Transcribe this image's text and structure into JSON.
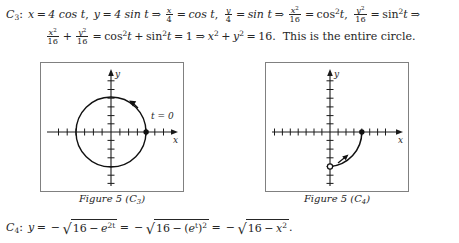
{
  "document": {
    "line1": {
      "id": "C",
      "id_sub": "3",
      "colon": ":",
      "x_var": "x",
      "eq": "=",
      "x_expr": "4 cos t",
      "comma": ",",
      "y_var": "y",
      "y_expr": "4 sin t",
      "implies": "⇒",
      "frac1_num": "x",
      "frac1_den": "4",
      "frac1_rhs": "cos t",
      "frac2_num": "y",
      "frac2_den": "4",
      "frac2_rhs": "sin t",
      "frac3_num": "x",
      "frac3_num_sup": "2",
      "frac3_den": "16",
      "frac3_rhs_base": "cos",
      "frac3_rhs_sup": "2",
      "frac3_rhs_arg": "t",
      "frac4_num": "y",
      "frac4_num_sup": "2",
      "frac4_den": "16",
      "frac4_rhs_base": "sin",
      "frac4_rhs_sup": "2",
      "frac4_rhs_arg": "t",
      "plain_text": "C3: x = 4 cos t, y = 4 sin t ⇒ x/4 = cos t, y/4 = sin t ⇒ x²/16 = cos²t, y²/16 = sin²t ⇒"
    },
    "line2": {
      "f1_num": "x",
      "f1_num_sup": "2",
      "f1_den": "16",
      "plus": "+",
      "f2_num": "y",
      "f2_num_sup": "2",
      "f2_den": "16",
      "eq1": "=",
      "cos_base": "cos",
      "cos_sup": "2",
      "cos_arg": "t",
      "plus2": "+",
      "sin_base": "sin",
      "sin_sup": "2",
      "sin_arg": "t",
      "eq2": "=",
      "one": "1",
      "implies": "⇒",
      "x_var": "x",
      "x_sup": "2",
      "plus3": "+",
      "y_var": "y",
      "y_sup": "2",
      "eq3": "=",
      "sixteen": "16.",
      "sentence": "This is the entire circle.",
      "plain_text": "x²/16 + y²/16 = cos²t + sin²t = 1 ⇒ x² + y² = 16.  This is the entire circle."
    },
    "line3": {
      "id": "C",
      "id_sub": "4",
      "colon": ":",
      "y_var": "y",
      "eq1": "=",
      "minus1": "−",
      "rad1_a": "16",
      "rad1_minus": "−",
      "rad1_b_base": "e",
      "rad1_b_sup": "2t",
      "eq2": "=",
      "minus2": "−",
      "rad2_a": "16",
      "rad2_minus": "−",
      "rad2_b_open": "(",
      "rad2_b_base": "e",
      "rad2_b_inner_sup": "t",
      "rad2_b_close": ")",
      "rad2_b_sup": "2",
      "eq3": "=",
      "minus3": "−",
      "rad3_a": "16",
      "rad3_minus": "−",
      "rad3_b_base": "x",
      "rad3_b_sup": "2",
      "period": ".",
      "plain_text": "C4: y = −√(16 − e^{2t}) = −√(16 − (e^t)²) = −√(16 − x²)."
    }
  },
  "figures": [
    {
      "key": "c3",
      "caption_prefix": "Figure 5 (",
      "caption_id": "C",
      "caption_sub": "3",
      "caption_suffix": ")",
      "caption_plain": "Figure 5 (C3)",
      "x_axis_label": "x",
      "y_axis_label": "y",
      "annotation": "t = 0",
      "curve_type": "circle",
      "circle_radius_units": 4,
      "start_point": {
        "x": 4,
        "y": 0,
        "filled": true
      },
      "direction": "counterclockwise",
      "x_ticks": [
        -6,
        -5,
        -4,
        -3,
        -2,
        -1,
        1,
        2,
        3,
        4,
        5,
        6
      ],
      "y_ticks": [
        -6,
        -5,
        -4,
        -3,
        -2,
        -1,
        1,
        2,
        3,
        4,
        5,
        6
      ],
      "axis_color": "#1a1a1a",
      "frame_color": "#808080"
    },
    {
      "key": "c4",
      "caption_prefix": "Figure 5 (",
      "caption_id": "C",
      "caption_sub": "4",
      "caption_suffix": ")",
      "caption_plain": "Figure 5 (C4)",
      "x_axis_label": "x",
      "y_axis_label": "y",
      "annotation": "",
      "curve_type": "quarter-arc",
      "start_point": {
        "x": 0,
        "y": -4,
        "filled": false
      },
      "end_point": {
        "x": 4,
        "y": 0,
        "filled": true
      },
      "direction": "rightward-upward",
      "x_ticks": [
        -7,
        -6,
        -5,
        -4,
        -3,
        -2,
        -1,
        1,
        2,
        3,
        4,
        5,
        6,
        7
      ],
      "y_ticks": [
        -6,
        -5,
        -4,
        -3,
        -2,
        -1,
        1,
        2,
        3,
        4,
        5,
        6
      ],
      "axis_color": "#1a1a1a",
      "frame_color": "#808080"
    }
  ],
  "colors": {
    "text": "#262626",
    "frame": "#808080",
    "axis": "#1a1a1a",
    "curve": "#111111",
    "background": "#ffffff"
  }
}
